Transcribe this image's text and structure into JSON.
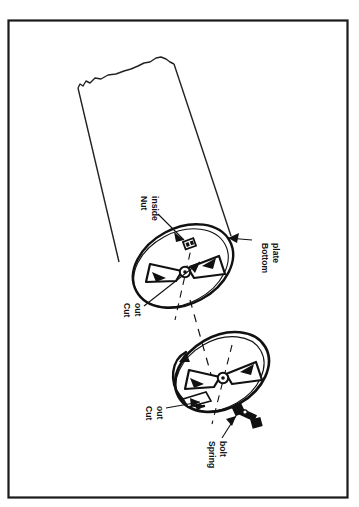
{
  "figure": {
    "caption_partial": "F",
    "background_color": "#ffffff",
    "ink_color": "#111111",
    "border_color": "#1a1a1a",
    "frame": {
      "x": 8,
      "y": 20,
      "width": 340,
      "height": 478
    },
    "orientation": "rotated-90-landscape-content"
  },
  "labels": [
    {
      "id": "nut-inside",
      "lines": [
        "Nut",
        "inside"
      ],
      "line1": "Nut",
      "line2": "inside",
      "x": 141,
      "y": 196,
      "leader_to": {
        "x": 186,
        "y": 243
      }
    },
    {
      "id": "bottom-plate",
      "lines": [
        "Bottom",
        "plate"
      ],
      "line1": "Bottom",
      "line2": "plate",
      "x": 258,
      "y": 240,
      "leader_to": {
        "x": 232,
        "y": 238
      }
    },
    {
      "id": "cut-out-upper",
      "lines": [
        "Cut",
        "out"
      ],
      "line1": "Cut",
      "line2": "out",
      "x": 128,
      "y": 303,
      "leader_to": {
        "x": 196,
        "y": 265
      }
    },
    {
      "id": "cut-out-lower",
      "lines": [
        "Cut",
        "out"
      ],
      "line1": "Cut",
      "line2": "out",
      "x": 150,
      "y": 406,
      "leader_to": {
        "x": 204,
        "y": 390
      }
    },
    {
      "id": "spring-bolt",
      "lines": [
        "Spring",
        "bolt"
      ],
      "line1": "Spring",
      "line2": "bolt",
      "x": 212,
      "y": 440,
      "leader_to": {
        "x": 238,
        "y": 418
      }
    }
  ],
  "parts": {
    "cylinder": {
      "name": "cylindrical body with torn top edge",
      "torn_edge": true
    },
    "upper_disc": {
      "name": "bottom plate with wing nut installed"
    },
    "lower_disc": {
      "name": "detached bottom plate with wing nut and rotation arrow"
    },
    "axis_line": {
      "name": "dashed assembly centerline",
      "style": "dashed"
    },
    "rotation_arrow": {
      "name": "curved rotation arrow"
    }
  }
}
